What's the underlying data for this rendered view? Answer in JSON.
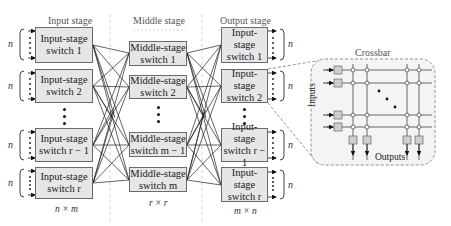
{
  "diagram": {
    "type": "three-stage Clos network",
    "stages": [
      {
        "title": "Input stage",
        "dimension": "n × m",
        "switches": [
          {
            "line1": "Input-stage",
            "line2": "switch 1"
          },
          {
            "line1": "Input-stage",
            "line2": "switch 2"
          },
          {
            "line1": "Input-stage",
            "line2": "switch r − 1"
          },
          {
            "line1": "Input-stage",
            "line2": "switch r"
          }
        ],
        "port_label": "n"
      },
      {
        "title": "Middle stage",
        "dimension": "r × r",
        "switches": [
          {
            "line1": "Middle-stage",
            "line2": "switch 1"
          },
          {
            "line1": "Middle-stage",
            "line2": "switch 2"
          },
          {
            "line1": "Middle-stage",
            "line2": "switch m − 1"
          },
          {
            "line1": "Middle-stage",
            "line2": "switch m"
          }
        ]
      },
      {
        "title": "Output stage",
        "dimension": "m × n",
        "switches": [
          {
            "line1": "Input-stage",
            "line2": "switch 1"
          },
          {
            "line1": "Input-stage",
            "line2": "switch 2"
          },
          {
            "line1": "Input-stage",
            "line2": "switch r − 1"
          },
          {
            "line1": "Input-stage",
            "line2": "switch r"
          }
        ],
        "port_label": "n"
      }
    ],
    "crossbar": {
      "title": "Crossbar",
      "inputs_label": "Inputs",
      "outputs_label": "Outputs"
    },
    "colors": {
      "box_fill": "#e6e6e6",
      "box_stroke": "#6a6a6a",
      "line": "#222222",
      "dashed": "#777777",
      "crossbar_bg": "#f4f4f4"
    }
  }
}
